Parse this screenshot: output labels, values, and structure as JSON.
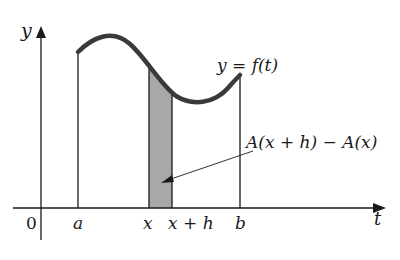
{
  "figure": {
    "axes": {
      "y_label": "y",
      "x_label": "t",
      "origin_label": "0"
    },
    "tick_labels": {
      "a": "a",
      "x": "x",
      "x_plus_h": "x + h",
      "b": "b"
    },
    "curve_label": "y = f(t)",
    "annotation": "A(x + h) − A(x)",
    "colors": {
      "ink": "#1a1a1a",
      "curve": "#3a3a3a",
      "shade": "#a8a8a8",
      "background": "#ffffff"
    }
  }
}
